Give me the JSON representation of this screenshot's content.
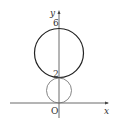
{
  "diagram": {
    "axes": {
      "x_label": "x",
      "y_label": "y",
      "origin_label": "O"
    },
    "tick_labels": {
      "y_6": "6",
      "y_2": "2"
    },
    "circles": [
      {
        "name": "large-circle",
        "center": [
          0,
          4
        ],
        "radius": 2,
        "color": "#333333"
      },
      {
        "name": "small-circle",
        "center": [
          0,
          1
        ],
        "radius": 1,
        "color": "#777777"
      }
    ]
  }
}
